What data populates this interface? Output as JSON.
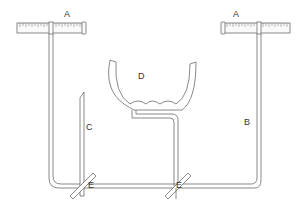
{
  "diagram": {
    "type": "apparatus line drawing",
    "labels": {
      "A_left": "A",
      "A_right": "A",
      "B": "B",
      "C": "C",
      "D": "D",
      "E_left": "E",
      "E_right": "E"
    },
    "colors": {
      "stroke": "#6b6b6b",
      "background": "#ffffff",
      "label": "#333333"
    }
  }
}
